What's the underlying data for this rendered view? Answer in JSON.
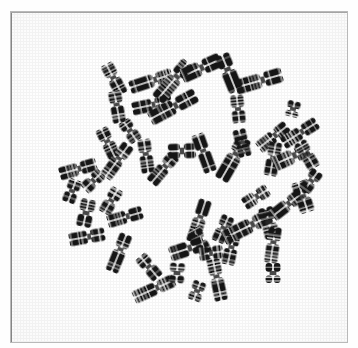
{
  "figure": {
    "kind": "micrograph",
    "caption": "",
    "background_color": "#ffffff",
    "frame_color": "#b9b9b9",
    "stain_color": "#141414",
    "band_color": "#2b2b2b",
    "width": 358,
    "height": 348,
    "frame": {
      "x": 10,
      "y": 11,
      "width": 338,
      "height": 332
    }
  },
  "chart_data": {
    "type": "scatter",
    "title": "",
    "subtitle": "",
    "xlabel": "",
    "ylabel": "",
    "xlim": [
      10,
      348
    ],
    "ylim": [
      11,
      343
    ],
    "grid": false,
    "legend": "none",
    "annotations": [],
    "tick_labels": {
      "x": [],
      "y": []
    },
    "series": [
      {
        "name": "chromosomes",
        "count": 52,
        "units": "px",
        "points": [
          {
            "id": "c01",
            "x": 113,
            "y": 78,
            "len": 17,
            "w": 7,
            "rot": -28,
            "arms": [
              0.45,
              0.55
            ],
            "shape": "submeta"
          },
          {
            "id": "c02",
            "x": 116,
            "y": 106,
            "len": 16,
            "w": 7,
            "rot": -10,
            "arms": [
              0.42,
              0.58
            ],
            "shape": "submeta"
          },
          {
            "id": "c03",
            "x": 150,
            "y": 80,
            "len": 22,
            "w": 7,
            "rot": 72,
            "arms": [
              0.4,
              0.6
            ],
            "shape": "submeta"
          },
          {
            "id": "c04",
            "x": 151,
            "y": 104,
            "len": 20,
            "w": 7,
            "rot": 78,
            "arms": [
              0.46,
              0.54
            ],
            "shape": "submeta"
          },
          {
            "id": "c05",
            "x": 172,
            "y": 80,
            "len": 24,
            "w": 8,
            "rot": 40,
            "arms": [
              0.38,
              0.62
            ],
            "shape": "submeta"
          },
          {
            "id": "c06",
            "x": 172,
            "y": 106,
            "len": 26,
            "w": 8,
            "rot": 62,
            "arms": [
              0.44,
              0.56
            ],
            "shape": "submeta"
          },
          {
            "id": "c07",
            "x": 200,
            "y": 67,
            "len": 21,
            "w": 8,
            "rot": 66,
            "arms": [
              0.48,
              0.52
            ],
            "shape": "meta"
          },
          {
            "id": "c08",
            "x": 228,
            "y": 72,
            "len": 20,
            "w": 8,
            "rot": -22,
            "arms": [
              0.4,
              0.6
            ],
            "shape": "submeta"
          },
          {
            "id": "c09",
            "x": 258,
            "y": 80,
            "len": 24,
            "w": 8,
            "rot": 74,
            "arms": [
              0.42,
              0.58
            ],
            "shape": "submeta"
          },
          {
            "id": "c10",
            "x": 237,
            "y": 108,
            "len": 14,
            "w": 7,
            "rot": -6,
            "arms": [
              0.5,
              0.5
            ],
            "shape": "meta"
          },
          {
            "id": "c11",
            "x": 292,
            "y": 108,
            "len": 8,
            "w": 7,
            "rot": 14,
            "arms": [
              0.5,
              0.5
            ],
            "shape": "dot"
          },
          {
            "id": "c12",
            "x": 107,
            "y": 142,
            "len": 16,
            "w": 7,
            "rot": -26,
            "arms": [
              0.44,
              0.56
            ],
            "shape": "submeta"
          },
          {
            "id": "c13",
            "x": 116,
            "y": 160,
            "len": 20,
            "w": 7,
            "rot": 36,
            "arms": [
              0.42,
              0.58
            ],
            "shape": "submeta"
          },
          {
            "id": "c14",
            "x": 77,
            "y": 168,
            "len": 19,
            "w": 7,
            "rot": 74,
            "arms": [
              0.46,
              0.54
            ],
            "shape": "submeta"
          },
          {
            "id": "c15",
            "x": 145,
            "y": 155,
            "len": 17,
            "w": 7,
            "rot": -8,
            "arms": [
              0.44,
              0.56
            ],
            "shape": "submeta"
          },
          {
            "id": "c16",
            "x": 162,
            "y": 168,
            "len": 18,
            "w": 7,
            "rot": 40,
            "arms": [
              0.4,
              0.6
            ],
            "shape": "submeta"
          },
          {
            "id": "c17",
            "x": 181,
            "y": 150,
            "len": 14,
            "w": 8,
            "rot": 88,
            "arms": [
              0.5,
              0.5
            ],
            "shape": "meta"
          },
          {
            "id": "c18",
            "x": 203,
            "y": 152,
            "len": 20,
            "w": 7,
            "rot": -20,
            "arms": [
              0.44,
              0.56
            ],
            "shape": "submeta"
          },
          {
            "id": "c19",
            "x": 232,
            "y": 158,
            "len": 24,
            "w": 8,
            "rot": 30,
            "arms": [
              0.38,
              0.62
            ],
            "shape": "submeta"
          },
          {
            "id": "c20",
            "x": 241,
            "y": 142,
            "len": 14,
            "w": 7,
            "rot": -14,
            "arms": [
              0.48,
              0.52
            ],
            "shape": "meta"
          },
          {
            "id": "c21",
            "x": 272,
            "y": 136,
            "len": 18,
            "w": 7,
            "rot": 52,
            "arms": [
              0.42,
              0.58
            ],
            "shape": "submeta"
          },
          {
            "id": "c22",
            "x": 299,
            "y": 132,
            "len": 20,
            "w": 7,
            "rot": 58,
            "arms": [
              0.44,
              0.56
            ],
            "shape": "submeta"
          },
          {
            "id": "c23",
            "x": 272,
            "y": 158,
            "len": 17,
            "w": 7,
            "rot": 10,
            "arms": [
              0.46,
              0.54
            ],
            "shape": "submeta"
          },
          {
            "id": "c24",
            "x": 290,
            "y": 156,
            "len": 19,
            "w": 8,
            "rot": 66,
            "arms": [
              0.4,
              0.6
            ],
            "shape": "submeta"
          },
          {
            "id": "c25",
            "x": 306,
            "y": 154,
            "len": 15,
            "w": 7,
            "rot": -30,
            "arms": [
              0.46,
              0.54
            ],
            "shape": "submeta"
          },
          {
            "id": "c26",
            "x": 110,
            "y": 200,
            "len": 14,
            "w": 7,
            "rot": 30,
            "arms": [
              0.48,
              0.52
            ],
            "shape": "meta"
          },
          {
            "id": "c27",
            "x": 124,
            "y": 216,
            "len": 18,
            "w": 7,
            "rot": 74,
            "arms": [
              0.42,
              0.58
            ],
            "shape": "submeta"
          },
          {
            "id": "c28",
            "x": 85,
            "y": 212,
            "len": 14,
            "w": 8,
            "rot": 12,
            "arms": [
              0.5,
              0.5
            ],
            "shape": "meta"
          },
          {
            "id": "c29",
            "x": 86,
            "y": 236,
            "len": 18,
            "w": 7,
            "rot": 80,
            "arms": [
              0.44,
              0.56
            ],
            "shape": "submeta"
          },
          {
            "id": "c30",
            "x": 118,
            "y": 252,
            "len": 20,
            "w": 7,
            "rot": 22,
            "arms": [
              0.4,
              0.6
            ],
            "shape": "submeta"
          },
          {
            "id": "c31",
            "x": 148,
            "y": 266,
            "len": 14,
            "w": 7,
            "rot": -40,
            "arms": [
              0.48,
              0.52
            ],
            "shape": "meta"
          },
          {
            "id": "c32",
            "x": 153,
            "y": 288,
            "len": 22,
            "w": 7,
            "rot": 66,
            "arms": [
              0.42,
              0.58
            ],
            "shape": "submeta"
          },
          {
            "id": "c33",
            "x": 176,
            "y": 272,
            "len": 10,
            "w": 8,
            "rot": 4,
            "arms": [
              0.5,
              0.5
            ],
            "shape": "dot"
          },
          {
            "id": "c34",
            "x": 196,
            "y": 290,
            "len": 10,
            "w": 7,
            "rot": 20,
            "arms": [
              0.5,
              0.5
            ],
            "shape": "dot"
          },
          {
            "id": "c35",
            "x": 216,
            "y": 278,
            "len": 22,
            "w": 7,
            "rot": -12,
            "arms": [
              0.44,
              0.56
            ],
            "shape": "submeta"
          },
          {
            "id": "c36",
            "x": 198,
            "y": 220,
            "len": 22,
            "w": 7,
            "rot": 18,
            "arms": [
              0.4,
              0.6
            ],
            "shape": "submeta"
          },
          {
            "id": "c37",
            "x": 199,
            "y": 240,
            "len": 14,
            "w": 7,
            "rot": -28,
            "arms": [
              0.48,
              0.52
            ],
            "shape": "meta"
          },
          {
            "id": "c38",
            "x": 222,
            "y": 228,
            "len": 14,
            "w": 7,
            "rot": 24,
            "arms": [
              0.46,
              0.54
            ],
            "shape": "submeta"
          },
          {
            "id": "c39",
            "x": 186,
            "y": 248,
            "len": 18,
            "w": 8,
            "rot": 72,
            "arms": [
              0.42,
              0.58
            ],
            "shape": "submeta"
          },
          {
            "id": "c40",
            "x": 210,
            "y": 252,
            "len": 12,
            "w": 7,
            "rot": 82,
            "arms": [
              0.5,
              0.5
            ],
            "shape": "meta"
          },
          {
            "id": "c41",
            "x": 230,
            "y": 248,
            "len": 16,
            "w": 7,
            "rot": 12,
            "arms": [
              0.44,
              0.56
            ],
            "shape": "submeta"
          },
          {
            "id": "c42",
            "x": 246,
            "y": 226,
            "len": 26,
            "w": 8,
            "rot": 64,
            "arms": [
              0.38,
              0.62
            ],
            "shape": "submeta"
          },
          {
            "id": "c43",
            "x": 268,
            "y": 222,
            "len": 16,
            "w": 8,
            "rot": -14,
            "arms": [
              0.46,
              0.54
            ],
            "shape": "submeta"
          },
          {
            "id": "c44",
            "x": 272,
            "y": 244,
            "len": 18,
            "w": 7,
            "rot": 8,
            "arms": [
              0.42,
              0.58
            ],
            "shape": "submeta"
          },
          {
            "id": "c45",
            "x": 286,
            "y": 204,
            "len": 18,
            "w": 7,
            "rot": 52,
            "arms": [
              0.44,
              0.56
            ],
            "shape": "submeta"
          },
          {
            "id": "c46",
            "x": 302,
            "y": 196,
            "len": 16,
            "w": 8,
            "rot": -18,
            "arms": [
              0.48,
              0.52
            ],
            "shape": "meta"
          },
          {
            "id": "c47",
            "x": 272,
            "y": 272,
            "len": 10,
            "w": 8,
            "rot": 0,
            "arms": [
              0.5,
              0.5
            ],
            "shape": "dot"
          },
          {
            "id": "c48",
            "x": 92,
            "y": 180,
            "len": 12,
            "w": 7,
            "rot": 46,
            "arms": [
              0.48,
              0.52
            ],
            "shape": "meta"
          },
          {
            "id": "c49",
            "x": 129,
            "y": 130,
            "len": 12,
            "w": 7,
            "rot": -34,
            "arms": [
              0.48,
              0.52
            ],
            "shape": "meta"
          },
          {
            "id": "c50",
            "x": 71,
            "y": 190,
            "len": 12,
            "w": 7,
            "rot": 20,
            "arms": [
              0.5,
              0.5
            ],
            "shape": "dot"
          },
          {
            "id": "c51",
            "x": 310,
            "y": 180,
            "len": 12,
            "w": 7,
            "rot": 36,
            "arms": [
              0.48,
              0.52
            ],
            "shape": "meta"
          },
          {
            "id": "c52",
            "x": 255,
            "y": 196,
            "len": 14,
            "w": 7,
            "rot": 58,
            "arms": [
              0.46,
              0.54
            ],
            "shape": "submeta"
          }
        ]
      }
    ]
  }
}
